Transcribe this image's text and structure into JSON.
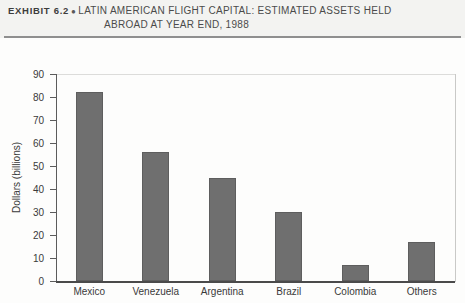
{
  "header": {
    "exhibit_label": "EXHIBIT 6.2",
    "bullet": "●",
    "title_line_1": "LATIN AMERICAN FLIGHT CAPITAL: ESTIMATED ASSETS HELD",
    "title_line_2": "ABROAD AT YEAR END, 1988"
  },
  "colors": {
    "bar_fill": "#6f6f6f",
    "bar_edge": "#5e5e5e",
    "axis": "#4a4a4a",
    "header_band": "#f3f3f1",
    "text": "#3a3a3a"
  },
  "chart_data": {
    "type": "bar",
    "xlabel": "",
    "ylabel": "Dollars (billions)",
    "ylim": [
      0,
      90
    ],
    "yticks": [
      0,
      10,
      20,
      30,
      40,
      50,
      60,
      70,
      80,
      90
    ],
    "ytick_labels": [
      "0",
      "10",
      "20",
      "30",
      "40",
      "50",
      "60",
      "70",
      "80",
      "90"
    ],
    "categories": [
      "Mexico",
      "Venezuela",
      "Argentina",
      "Brazil",
      "Colombia",
      "Others"
    ],
    "values": [
      82,
      56,
      45,
      30,
      7,
      17
    ],
    "grid": false,
    "legend": false
  }
}
